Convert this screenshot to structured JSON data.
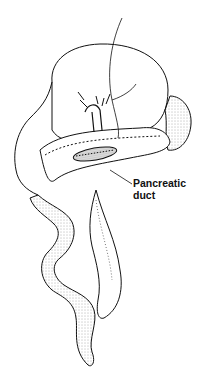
{
  "figure": {
    "labels": [
      {
        "id": "pancreatic-duct",
        "line1": "Pancreatic",
        "line2": "duct"
      }
    ],
    "colors": {
      "ink": "#111111",
      "shade": "#777777",
      "background": "#ffffff"
    }
  }
}
